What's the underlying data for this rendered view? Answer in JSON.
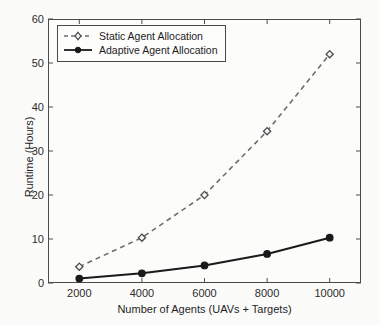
{
  "chart_data": {
    "type": "line",
    "title": "",
    "xlabel": "Number of Agents (UAVs + Targets)",
    "ylabel": "Runtime (Hours)",
    "x": [
      2000,
      4000,
      6000,
      8000,
      10000
    ],
    "xticklabels": [
      "2000",
      "4000",
      "6000",
      "8000",
      "10000"
    ],
    "yticklabels": [
      "0",
      "10",
      "20",
      "30",
      "40",
      "50",
      "60"
    ],
    "yticks": [
      0,
      10,
      20,
      30,
      40,
      50,
      60
    ],
    "xlim": [
      1000,
      11000
    ],
    "ylim": [
      0,
      60
    ],
    "grid": false,
    "legend_position": "upper-left",
    "series": [
      {
        "name": "Static Agent Allocation",
        "values": [
          3.7,
          10.3,
          20.0,
          34.5,
          52.0
        ],
        "color": "#6e6e6e",
        "linestyle": "dashed",
        "marker": "diamond",
        "marker_fill": "hollow"
      },
      {
        "name": "Adaptive Agent Allocation",
        "values": [
          1.0,
          2.2,
          4.0,
          6.6,
          10.3
        ],
        "color": "#1a1a1a",
        "linestyle": "solid",
        "marker": "circle",
        "marker_fill": "filled"
      }
    ]
  },
  "figure": {
    "background_color": "#fbfbfa",
    "axes_color": "#4a4a4a"
  }
}
